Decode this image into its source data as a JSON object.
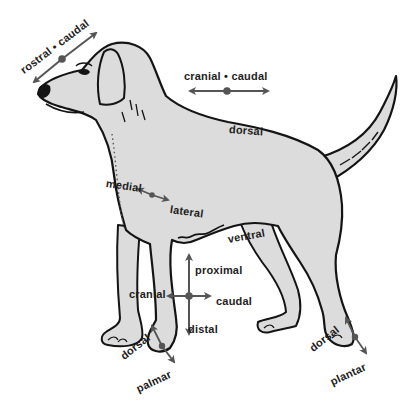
{
  "diagram": {
    "colors": {
      "body_fill": "#dcdcdc",
      "outline": "#141414",
      "arrow": "#555555",
      "text": "#1e1e1e",
      "background": "#ffffff"
    },
    "labels": {
      "rostral_caudal": "rostral • caudal",
      "cranial_caudal_top": "cranial • caudal",
      "dorsal_back": "dorsal",
      "medial": "medial",
      "lateral": "lateral",
      "ventral": "ventral",
      "proximal": "proximal",
      "cranial_leg": "cranial",
      "caudal_leg": "caudal",
      "distal": "distal",
      "dorsal_front_paw": "dorsal",
      "palmar": "palmar",
      "dorsal_hind_paw": "dorsal",
      "plantar": "plantar"
    }
  }
}
